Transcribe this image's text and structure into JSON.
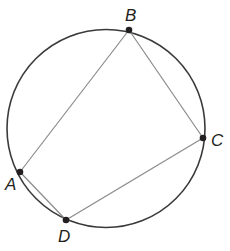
{
  "diagram": {
    "type": "inscribed-quadrilateral",
    "circle": {
      "cx": 106,
      "cy": 128.5,
      "r": 99,
      "stroke": "#3a3a3a"
    },
    "points": [
      {
        "id": "A",
        "label": "A",
        "x": 20,
        "y": 172,
        "label_x": 5,
        "label_y": 190
      },
      {
        "id": "B",
        "label": "B",
        "x": 129,
        "y": 30,
        "label_x": 125,
        "label_y": 21
      },
      {
        "id": "C",
        "label": "C",
        "x": 203,
        "y": 138,
        "label_x": 211,
        "label_y": 146
      },
      {
        "id": "D",
        "label": "D",
        "x": 66,
        "y": 220,
        "label_x": 58,
        "label_y": 242
      }
    ],
    "segments": [
      {
        "from": "A",
        "to": "B"
      },
      {
        "from": "B",
        "to": "C"
      },
      {
        "from": "C",
        "to": "D"
      },
      {
        "from": "D",
        "to": "A"
      }
    ],
    "colors": {
      "circle": "#3a3a3a",
      "segment": "#8a8a8a",
      "point": "#231f20",
      "label": "#231f20"
    }
  }
}
